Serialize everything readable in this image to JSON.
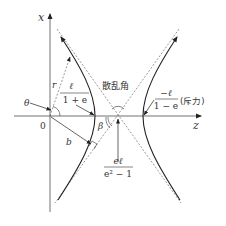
{
  "diagram": {
    "axes": {
      "vertical_label": "x",
      "horizontal_label": "z",
      "origin_label": "0"
    },
    "labels": {
      "theta": "θ",
      "r": "r",
      "b": "b",
      "beta": "β",
      "scattering_angle": "散乱角",
      "attractive_vertex": {
        "numerator": "ℓ",
        "denominator": "1 + e"
      },
      "repulsive_vertex": {
        "numerator": "−ℓ",
        "denominator": "1 − e",
        "note": "(斥力)"
      },
      "center_offset": {
        "numerator": "eℓ",
        "denominator": "e² − 1"
      }
    },
    "colors": {
      "line": "#222222",
      "dashed": "#555555",
      "text": "#333333",
      "background": "#ffffff"
    }
  }
}
